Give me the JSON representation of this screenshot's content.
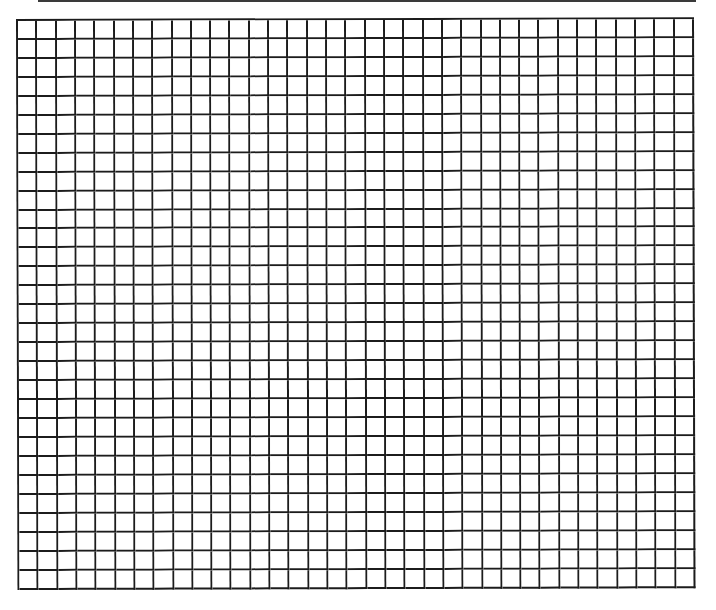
{
  "document": {
    "type": "blank-grid-worksheet",
    "grid": {
      "columns": 35,
      "rows": 30,
      "cell_width_px": 19.37,
      "cell_height_px": 19.0,
      "line_color": "#1c1c1c",
      "background_color": "#ffffff"
    },
    "top_frame": {
      "visible": true,
      "clipped": true,
      "line_color": "#3a3a3a"
    }
  }
}
